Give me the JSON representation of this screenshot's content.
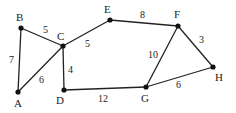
{
  "diagram": {
    "type": "weighted-undirected-graph",
    "colors": {
      "edge": "#222222",
      "node": "#111111",
      "text": "#222222",
      "background": "#ffffff"
    },
    "nodes": [
      {
        "id": "A",
        "label": "A",
        "x": 18,
        "y": 92,
        "lx": 14,
        "ly": 107
      },
      {
        "id": "B",
        "label": "B",
        "x": 21,
        "y": 28,
        "lx": 16,
        "ly": 21
      },
      {
        "id": "C",
        "label": "C",
        "x": 63,
        "y": 46,
        "lx": 57,
        "ly": 40
      },
      {
        "id": "D",
        "label": "D",
        "x": 64,
        "y": 90,
        "lx": 56,
        "ly": 104
      },
      {
        "id": "E",
        "label": "E",
        "x": 110,
        "y": 20,
        "lx": 104,
        "ly": 13
      },
      {
        "id": "F",
        "label": "F",
        "x": 178,
        "y": 26,
        "lx": 174,
        "ly": 18
      },
      {
        "id": "G",
        "label": "G",
        "x": 146,
        "y": 87,
        "lx": 141,
        "ly": 102
      },
      {
        "id": "H",
        "label": "H",
        "x": 213,
        "y": 67,
        "lx": 215,
        "ly": 81
      }
    ],
    "edges": [
      {
        "from": "A",
        "to": "B",
        "weight": "7",
        "lx": 9,
        "ly": 63
      },
      {
        "from": "B",
        "to": "C",
        "weight": "5",
        "lx": 43,
        "ly": 33
      },
      {
        "from": "A",
        "to": "C",
        "weight": "6",
        "lx": 39,
        "ly": 83
      },
      {
        "from": "C",
        "to": "D",
        "weight": "4",
        "lx": 68,
        "ly": 73
      },
      {
        "from": "C",
        "to": "E",
        "weight": "5",
        "lx": 85,
        "ly": 47
      },
      {
        "from": "E",
        "to": "F",
        "weight": "8",
        "lx": 140,
        "ly": 18
      },
      {
        "from": "D",
        "to": "G",
        "weight": "12",
        "lx": 98,
        "ly": 102
      },
      {
        "from": "F",
        "to": "G",
        "weight": "10",
        "lx": 148,
        "ly": 58
      },
      {
        "from": "F",
        "to": "H",
        "weight": "3",
        "lx": 199,
        "ly": 43
      },
      {
        "from": "G",
        "to": "H",
        "weight": "6",
        "lx": 176,
        "ly": 88
      }
    ]
  }
}
